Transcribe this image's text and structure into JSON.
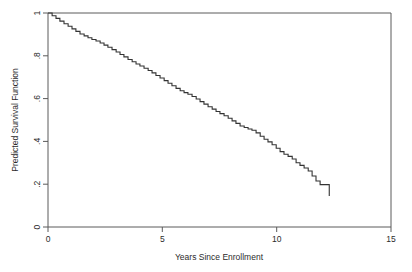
{
  "chart_data": {
    "type": "line",
    "title": "",
    "subtitle": "",
    "xlabel": "Years Since Enrollment",
    "ylabel": "Predicted Survival Function",
    "xlim": [
      0,
      15
    ],
    "ylim": [
      0,
      1
    ],
    "xticks": [
      0,
      5,
      10,
      15
    ],
    "xtick_labels": [
      "0",
      "5",
      "10",
      "15"
    ],
    "yticks": [
      0,
      0.2,
      0.4,
      0.6,
      0.8,
      1
    ],
    "ytick_labels": [
      "0",
      ".2",
      ".4",
      ".6",
      ".8",
      "1"
    ],
    "grid": false,
    "legend": "none",
    "step_style": "post",
    "line_color": "#333333",
    "frame_color": "#5a5a5a",
    "background": "#ffffff",
    "series": [
      {
        "name": "Predicted Survival Function",
        "x": [
          0.0,
          0.18,
          0.35,
          0.52,
          0.7,
          0.88,
          1.05,
          1.22,
          1.4,
          1.58,
          1.75,
          1.92,
          2.1,
          2.28,
          2.45,
          2.62,
          2.8,
          2.98,
          3.15,
          3.32,
          3.5,
          3.68,
          3.85,
          4.02,
          4.2,
          4.38,
          4.55,
          4.72,
          4.9,
          5.08,
          5.25,
          5.42,
          5.6,
          5.78,
          5.95,
          6.12,
          6.3,
          6.48,
          6.65,
          6.82,
          7.0,
          7.18,
          7.35,
          7.52,
          7.7,
          7.88,
          8.05,
          8.22,
          8.4,
          8.58,
          8.75,
          8.92,
          9.1,
          9.28,
          9.45,
          9.62,
          9.8,
          9.98,
          10.15,
          10.32,
          10.5,
          10.68,
          10.85,
          11.02,
          11.2,
          11.38,
          11.55,
          11.72,
          11.9,
          12.3
        ],
        "y": [
          1.0,
          0.987,
          0.975,
          0.962,
          0.95,
          0.938,
          0.926,
          0.914,
          0.902,
          0.893,
          0.884,
          0.876,
          0.869,
          0.86,
          0.85,
          0.84,
          0.829,
          0.818,
          0.806,
          0.795,
          0.783,
          0.772,
          0.762,
          0.752,
          0.742,
          0.731,
          0.72,
          0.708,
          0.696,
          0.684,
          0.672,
          0.66,
          0.648,
          0.637,
          0.628,
          0.62,
          0.61,
          0.598,
          0.586,
          0.574,
          0.562,
          0.551,
          0.54,
          0.53,
          0.52,
          0.508,
          0.496,
          0.484,
          0.472,
          0.465,
          0.458,
          0.452,
          0.44,
          0.424,
          0.41,
          0.398,
          0.384,
          0.368,
          0.352,
          0.34,
          0.33,
          0.318,
          0.3,
          0.288,
          0.276,
          0.262,
          0.238,
          0.215,
          0.198,
          0.145
        ]
      }
    ],
    "annotations": {
      "start_value": 1.0,
      "end_value": 0.145,
      "end_time": 12.3,
      "plateau_start": 11.9
    }
  },
  "axes": {
    "x_title": "Years Since Enrollment",
    "y_title": "Predicted Survival Function",
    "x_tick_0": "0",
    "x_tick_1": "5",
    "x_tick_2": "10",
    "x_tick_3": "15",
    "y_tick_0": "0",
    "y_tick_1": ".2",
    "y_tick_2": ".4",
    "y_tick_3": ".6",
    "y_tick_4": ".8",
    "y_tick_5": "1"
  }
}
